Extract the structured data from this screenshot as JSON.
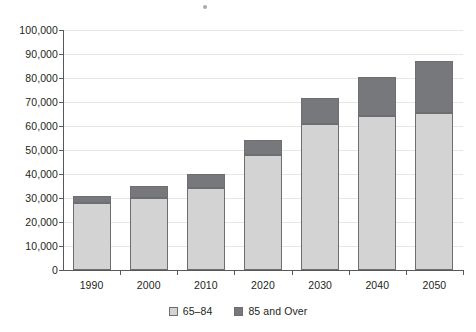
{
  "chart_data": {
    "type": "bar",
    "subtype": "stacked-vertical",
    "title": "",
    "subtitle": "",
    "xlabel": "",
    "ylabel": "",
    "categories": [
      "1990",
      "2000",
      "2010",
      "2020",
      "2030",
      "2040",
      "2050"
    ],
    "series": [
      {
        "name": "65–84",
        "color": "#d3d3d3",
        "values": [
          28000,
          30000,
          34000,
          48000,
          61000,
          64000,
          65500
        ]
      },
      {
        "name": "85 and Over",
        "color": "#77787b",
        "values": [
          3000,
          4800,
          5800,
          6200,
          10500,
          16300,
          21500
        ]
      }
    ],
    "totals": [
      31000,
      34800,
      39800,
      54200,
      71500,
      80300,
      87000
    ],
    "ylim": [
      0,
      100000
    ],
    "ytick_values": [
      0,
      10000,
      20000,
      30000,
      40000,
      50000,
      60000,
      70000,
      80000,
      90000,
      100000
    ],
    "ytick_labels": [
      "0",
      "10,000",
      "20,000",
      "30,000",
      "40,000",
      "50,000",
      "60,000",
      "70,000",
      "80,000",
      "90,000",
      "100,000"
    ],
    "grid": true,
    "grid_axis": "y",
    "legend_position": "bottom",
    "legend": [
      "65–84",
      "85 and Over"
    ]
  },
  "axes": {
    "y_labels": [
      "100,000",
      "90,000",
      "80,000",
      "70,000",
      "60,000",
      "50,000",
      "40,000",
      "30,000",
      "20,000",
      "10,000",
      "0"
    ],
    "x_labels": [
      "1990",
      "2000",
      "2010",
      "2020",
      "2030",
      "2040",
      "2050"
    ]
  },
  "legend": {
    "items": [
      {
        "label": "65–84",
        "swatch": "light-gray-swatch",
        "color": "#d3d3d3"
      },
      {
        "label": "85 and Over",
        "swatch": "dark-gray-swatch",
        "color": "#77787b"
      }
    ]
  },
  "colors": {
    "series_lower": "#d3d3d3",
    "series_upper": "#77787b",
    "bar_border": "#6d6e71",
    "gridline": "#e6e6e6",
    "axis": "#58595b",
    "text": "#231f20",
    "background": "#ffffff"
  }
}
